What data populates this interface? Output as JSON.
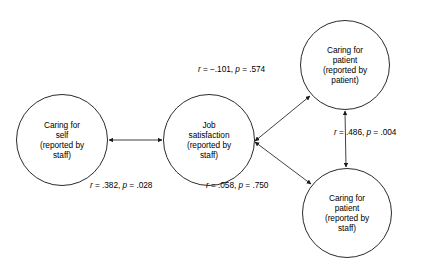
{
  "diagram": {
    "background_color": "#ffffff",
    "line_color": "#2b2b2b",
    "nodes": [
      {
        "id": "caring-for-self-staff",
        "lines": [
          "Caring for",
          "self",
          "(reported by",
          "staff)"
        ],
        "cx": 62,
        "cy": 140,
        "r": 46
      },
      {
        "id": "job-satisfaction-staff",
        "lines": [
          "Job",
          "satisfaction",
          "(reported by",
          "staff)"
        ],
        "cx": 209,
        "cy": 140,
        "r": 46
      },
      {
        "id": "caring-for-patient-patient",
        "lines": [
          "Caring for",
          "patient",
          "(reported by",
          "patient)"
        ],
        "cx": 345,
        "cy": 65,
        "r": 45
      },
      {
        "id": "caring-for-patient-staff",
        "lines": [
          "Caring for",
          "patient",
          "(reported by",
          "staff)"
        ],
        "cx": 347,
        "cy": 213,
        "r": 45
      }
    ],
    "edges": [
      {
        "id": "self-to-jobsat",
        "from": "caring-for-self-staff",
        "to": "job-satisfaction-staff",
        "arrow": "double",
        "r": ".382",
        "p": ".028",
        "label": "r = .382, p = .028",
        "label_x": 90,
        "label_y": 182
      },
      {
        "id": "jobsat-to-patient-patient",
        "from": "job-satisfaction-staff",
        "to": "caring-for-patient-patient",
        "arrow": "double",
        "r": "−.101",
        "p": ".574",
        "label": "r = −.101, p = .574",
        "label_x": 198,
        "label_y": 65
      },
      {
        "id": "jobsat-to-patient-staff",
        "from": "job-satisfaction-staff",
        "to": "caring-for-patient-staff",
        "arrow": "double",
        "r": ".058",
        "p": ".750",
        "label": "r = .058, p = .750",
        "label_x": 206,
        "label_y": 182
      },
      {
        "id": "patient-patient-to-patient-staff",
        "from": "caring-for-patient-patient",
        "to": "caring-for-patient-staff",
        "arrow": "double",
        "r": ".486",
        "p": ".004",
        "label": "r = .486, p = .004",
        "label_x": 334,
        "label_y": 128
      }
    ]
  }
}
